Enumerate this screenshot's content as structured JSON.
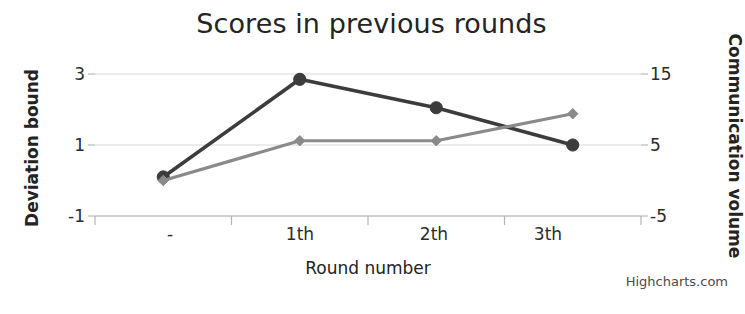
{
  "chart_data": {
    "type": "line",
    "title": "Scores in previous rounds",
    "xlabel": "Round number",
    "ylabel": "Deviation bound",
    "y2label": "Communication volume",
    "categories": [
      "-",
      "1th",
      "2th",
      "3th"
    ],
    "grid": true,
    "legend": "none",
    "ylim": [
      -1,
      3
    ],
    "yticks": [
      "3",
      "1",
      "-1"
    ],
    "ytick_values": [
      3,
      1,
      -1
    ],
    "y2lim": [
      -5,
      15
    ],
    "y2ticks": [
      "15",
      "5",
      "-5"
    ],
    "y2tick_values": [
      15,
      5,
      -5
    ],
    "series": [
      {
        "name": "Deviation bound",
        "axis": "left",
        "marker": "circle",
        "color": "#3c3c3c",
        "values": [
          0.1,
          2.85,
          2.05,
          1.0
        ]
      },
      {
        "name": "Communication volume",
        "axis": "right",
        "marker": "diamond",
        "color": "#8a8a8a",
        "values": [
          0,
          5.6,
          5.6,
          9.4
        ]
      }
    ]
  },
  "credit": {
    "label": "Highcharts.com"
  },
  "colors": {
    "series_dark": "#3c3c3c",
    "series_gray": "#8a8a8a",
    "gridline": "#d8d8d8",
    "axisline": "#b4b4b4",
    "text": "#2b2b2b"
  }
}
